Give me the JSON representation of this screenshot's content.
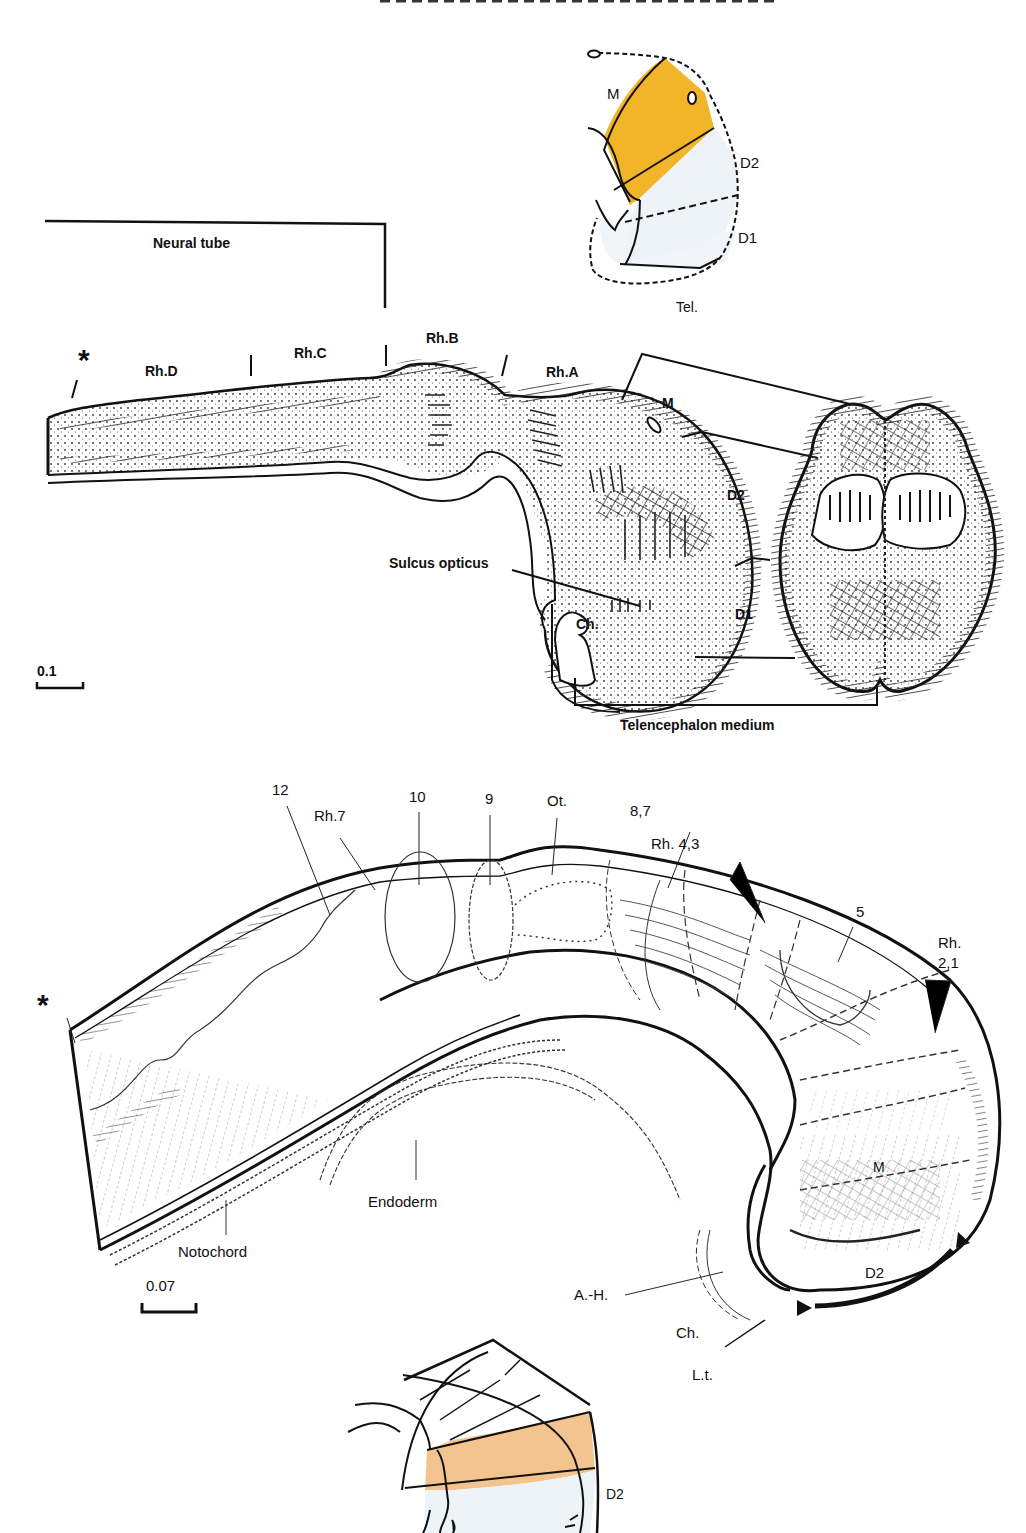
{
  "figure": {
    "top_caption_fragment": "…",
    "panel_a": {
      "inset_labels": {
        "m": "M",
        "d2": "D2",
        "d1": "D1",
        "tel": "Tel."
      },
      "inset_colors": {
        "m_region": "#f2b52a",
        "diencephalon_region": "#eef3f8"
      },
      "bracket_label": "Neural tube",
      "star": "*",
      "segments": [
        "Rh.D",
        "Rh.C",
        "Rh.B",
        "Rh.A"
      ],
      "region_labels": {
        "m": "M",
        "d2": "D2",
        "d1": "D1",
        "ch": "Ch."
      },
      "sulcus_label": "Sulcus opticus",
      "telencephalon_label": "Telencephalon medium",
      "scale_bar": "0.1"
    },
    "panel_b": {
      "star": "*",
      "top_labels": [
        "12",
        "Rh.7",
        "10",
        "9",
        "Ot.",
        "8,7",
        "Rh. 4,3",
        "5",
        "Rh.",
        "2,1"
      ],
      "region_labels": {
        "m": "M",
        "d2": "D2"
      },
      "endoderm_label": "Endoderm",
      "notochord_label": "Notochord",
      "ah_label": "A.-H.",
      "ch_label": "Ch.",
      "lt_label": "L.t.",
      "scale_bar": "0.07",
      "inset_labels": {
        "d2": "D2"
      },
      "inset_colors": {
        "d2_region": "#f3c48f",
        "below_region": "#eef3f8"
      }
    }
  }
}
